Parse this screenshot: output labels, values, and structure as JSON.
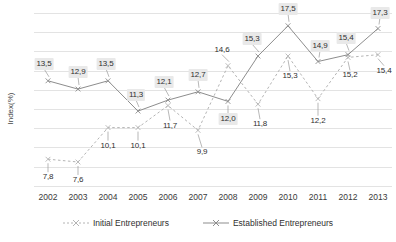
{
  "chart_data": {
    "type": "line",
    "title": "",
    "xlabel": "",
    "ylabel": "Index(%)",
    "categories": [
      "2002",
      "2003",
      "2004",
      "2005",
      "2006",
      "2007",
      "2008",
      "2009",
      "2010",
      "2011",
      "2012",
      "2013"
    ],
    "ylim": [
      6.0,
      18.5
    ],
    "grid": true,
    "legend_position": "bottom",
    "decimal_separator": ",",
    "series": [
      {
        "name": "Initial Entrepreneurs",
        "style": "dotted",
        "marker": "cross",
        "color": "#b4b4b4",
        "label_boxed": false,
        "values": [
          7.8,
          7.6,
          10.1,
          10.1,
          11.7,
          9.9,
          14.6,
          11.8,
          15.3,
          12.2,
          15.2,
          15.4
        ],
        "labels": [
          "7,8",
          "7,6",
          "10,1",
          "10,1",
          "11,7",
          "9,9",
          "14,6",
          "11,8",
          "15,3",
          "12,2",
          "15,2",
          "15,4"
        ]
      },
      {
        "name": "Established Entrepreneurs",
        "style": "solid",
        "marker": "cross",
        "color": "#8d8d8d",
        "label_boxed": true,
        "values": [
          13.5,
          12.9,
          13.5,
          11.3,
          12.1,
          12.7,
          12.0,
          15.3,
          17.5,
          14.9,
          15.4,
          17.3
        ],
        "labels": [
          "13,5",
          "12,9",
          "13,5",
          "11,3",
          "12,1",
          "12,7",
          "12,0",
          "15,3",
          "17,5",
          "14,9",
          "15,4",
          "17,3"
        ]
      }
    ]
  },
  "axis": {
    "y_title": "Index(%)",
    "x_ticks": [
      "2002",
      "2003",
      "2004",
      "2005",
      "2006",
      "2007",
      "2008",
      "2009",
      "2010",
      "2011",
      "2012",
      "2013"
    ]
  },
  "legend": {
    "items": [
      {
        "label": "Initial Entrepreneurs"
      },
      {
        "label": "Established Entrepreneurs"
      }
    ]
  }
}
